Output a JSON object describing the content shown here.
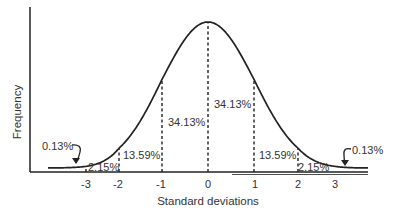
{
  "chart_data": {
    "type": "line",
    "title": "",
    "xlabel": "Standard deviations",
    "ylabel": "Frequency",
    "xlim": [
      -4,
      4
    ],
    "x_ticks": [
      "-3",
      "-2",
      "-1",
      "0",
      "1",
      "2",
      "3"
    ],
    "series": [
      {
        "name": "Normal distribution",
        "distribution": "normal",
        "mean": 0,
        "sd": 1
      }
    ],
    "divisions": [
      -3,
      -2,
      -1,
      0,
      1,
      2
    ],
    "region_labels": [
      {
        "id": "left-tail",
        "text": "0.13%",
        "region": "below -3",
        "arrow": true
      },
      {
        "id": "left-2-3",
        "text": "2.15%",
        "region": "-3 to -2"
      },
      {
        "id": "left-1-2",
        "text": "13.59%",
        "region": "-2 to -1"
      },
      {
        "id": "left-0-1",
        "text": "34.13%",
        "region": "-1 to 0"
      },
      {
        "id": "right-0-1",
        "text": "34.13%",
        "region": "0 to 1"
      },
      {
        "id": "right-1-2",
        "text": "13.59%",
        "region": "1 to 2"
      },
      {
        "id": "right-2-3",
        "text": "2.15%",
        "region": "2 to 3"
      },
      {
        "id": "right-tail",
        "text": "0.13%",
        "region": "above 3",
        "arrow": true
      }
    ],
    "grid": false,
    "legend": "none",
    "colors": {
      "ink": "#222222",
      "text": "#333333"
    }
  }
}
